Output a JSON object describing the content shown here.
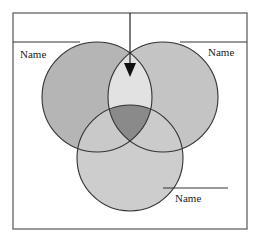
{
  "diagram": {
    "type": "venn",
    "labels": {
      "top_left": "Name",
      "top_right": "Name",
      "bottom": "Name"
    },
    "colors": {
      "circle_left": "#b5b5b5",
      "circle_right": "#c4c4c4",
      "circle_bottom": "#cdcdcd",
      "overlap_left_right": "#e2e2e2",
      "overlap_all": "#8a8a8a",
      "stroke": "#333333",
      "frame": "#555555"
    },
    "arrow": {
      "direction": "down",
      "points_to": "left-right-overlap"
    }
  }
}
